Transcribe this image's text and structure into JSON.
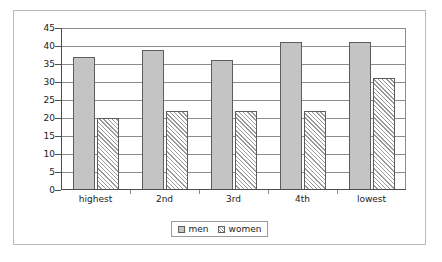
{
  "chart_data": {
    "type": "bar",
    "title": "",
    "subtitle": "",
    "xlabel": "",
    "ylabel": "",
    "categories": [
      "highest",
      "2nd",
      "3rd",
      "4th",
      "lowest"
    ],
    "series": [
      {
        "name": "men",
        "values": [
          37,
          39,
          36,
          41,
          41
        ],
        "color": "#c4c4c4",
        "fill": "solid"
      },
      {
        "name": "women",
        "values": [
          20,
          22,
          22,
          22,
          31
        ],
        "color": "#ffffff",
        "fill": "diagonal-hatch"
      }
    ],
    "ylim": [
      0,
      45
    ],
    "y_ticks": [
      0,
      5,
      10,
      15,
      20,
      25,
      30,
      35,
      40,
      45
    ],
    "y_tick_labels": [
      "0",
      "5",
      "10",
      "15",
      "20",
      "25",
      "30",
      "35",
      "40",
      "45"
    ],
    "grid": true,
    "grid_axis": "y",
    "legend_position": "bottom",
    "legend_entries": [
      "men",
      "women"
    ]
  },
  "frame": {
    "border_color": "#b9b9b9",
    "background": "#ffffff"
  }
}
